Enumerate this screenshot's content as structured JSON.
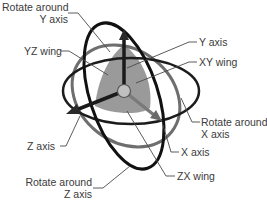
{
  "diagram": {
    "colors": {
      "ring_dark": "#111111",
      "ring_gray": "#6e6e6e",
      "wing_fill": "#9a9a9a",
      "axis_arrow": "#1a1a1a",
      "center_ball": "#b8b8b8",
      "leader_line": "#4a4a4a",
      "label_text": "#3a3a3a"
    },
    "labels": {
      "rotate_y_line1": "Rotate around",
      "rotate_y_line2": "Y axis",
      "yz_wing": "YZ wing",
      "y_axis": "Y axis",
      "xy_wing": "XY wing",
      "rotate_x_line1": "Rotate around",
      "rotate_x_line2": "X axis",
      "z_axis": "Z axis",
      "x_axis": "X axis",
      "rotate_z_line1": "Rotate around",
      "rotate_z_line2": "Z axis",
      "zx_wing": "ZX wing"
    }
  }
}
